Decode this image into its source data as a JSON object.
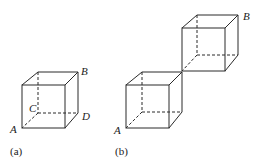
{
  "figures": [
    {
      "id": "a",
      "caption": "(a)",
      "description": "Single cube with labeled vertices",
      "vertex_labels": {
        "A": "A",
        "B": "B",
        "C": "C",
        "D": "D"
      }
    },
    {
      "id": "b",
      "caption": "(b)",
      "description": "Two cubes joined at a single edge/corner, stacked diagonally",
      "vertex_labels": {
        "A": "A",
        "B": "B"
      }
    }
  ],
  "colors": {
    "line": "#2a2a2a",
    "text": "#222222",
    "background": "#ffffff"
  }
}
